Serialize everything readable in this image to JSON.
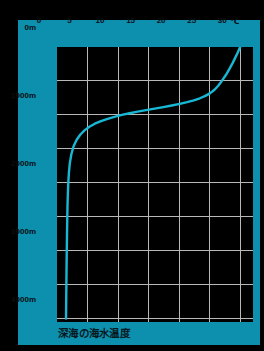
{
  "figure": {
    "caption": "深海の海水温度",
    "background_color": "#000000",
    "panel_color": "#0d8fae",
    "plot_color": "#000000",
    "grid_color": "#b9b9b9",
    "curve_color": "#18b8d4",
    "label_color": "#0a0d10"
  },
  "chart_data": {
    "type": "line",
    "title": "深海の海水温度",
    "xlabel": "℃",
    "ylabel": "",
    "xlim": [
      0,
      32.1
    ],
    "ylim": [
      4050,
      0
    ],
    "grid": true,
    "legend": "none",
    "x_unit": "℃",
    "x_ticks": [
      0,
      5,
      10,
      15,
      20,
      25,
      30
    ],
    "x_tick_labels": [
      "0",
      "5",
      "10",
      "15",
      "20",
      "25",
      "30"
    ],
    "y_ticks": [
      0,
      1000,
      2000,
      3000,
      4000
    ],
    "y_tick_labels": [
      "0m",
      "1000m",
      "2000m",
      "3000m",
      "4000m"
    ],
    "y_minor_ticks": [
      500,
      1500,
      2500,
      3500
    ],
    "series": [
      {
        "name": "海水温度",
        "color": "#18b8d4",
        "x": [
          30.0,
          29.4,
          28.8,
          28.2,
          27.6,
          27.0,
          26.4,
          25.8,
          25.1,
          24.3,
          23.4,
          22.4,
          21.3,
          20.1,
          18.8,
          17.4,
          16.0,
          14.6,
          13.2,
          11.9,
          10.6,
          9.4,
          8.3,
          7.2,
          6.2,
          5.3,
          4.5,
          3.8,
          3.2,
          2.7,
          2.35,
          2.1,
          1.95,
          1.85,
          1.78,
          1.72,
          1.68,
          1.64,
          1.6,
          1.56,
          1.52,
          1.48
        ],
        "y": [
          0,
          120,
          230,
          330,
          420,
          500,
          570,
          630,
          680,
          720,
          755,
          785,
          812,
          838,
          862,
          885,
          908,
          930,
          952,
          975,
          1000,
          1028,
          1058,
          1092,
          1130,
          1175,
          1228,
          1292,
          1370,
          1465,
          1580,
          1710,
          1850,
          2000,
          2160,
          2340,
          2540,
          2760,
          3000,
          3280,
          3620,
          4000
        ]
      }
    ]
  }
}
